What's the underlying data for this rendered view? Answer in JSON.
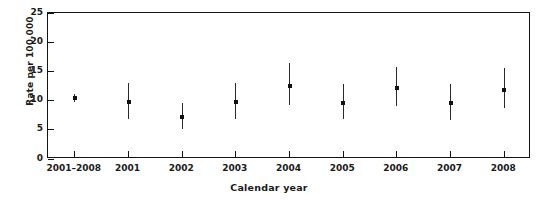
{
  "chart_data": {
    "type": "scatter",
    "title": "",
    "xlabel": "Calendar year",
    "ylabel": "Rate per 100,000",
    "categories": [
      "2001–2008",
      "2001",
      "2002",
      "2003",
      "2004",
      "2005",
      "2006",
      "2007",
      "2008"
    ],
    "values": [
      10.4,
      9.8,
      7.2,
      9.7,
      12.5,
      9.6,
      12.1,
      9.6,
      11.9
    ],
    "ci_low": [
      9.7,
      6.9,
      5.1,
      6.9,
      9.3,
      6.8,
      9.0,
      6.7,
      8.8
    ],
    "ci_high": [
      11.1,
      13.0,
      9.6,
      13.0,
      16.4,
      12.8,
      15.8,
      12.9,
      15.5
    ],
    "ylim": [
      0,
      25
    ],
    "yticks": [
      0,
      5,
      10,
      15,
      20,
      25
    ],
    "ytick_labels": [
      "0",
      "5",
      "10",
      "15",
      "20",
      "25"
    ],
    "grid": false,
    "legend": "none",
    "marker": "filled-square",
    "errorbar_style": "vertical-line"
  },
  "axes": {
    "y_title": "Rate per 100,000",
    "x_title": "Calendar year"
  },
  "colors": {
    "axis": "#141414",
    "marker": "#111111",
    "errorbar": "#2a2a2a",
    "background": "#ffffff"
  }
}
